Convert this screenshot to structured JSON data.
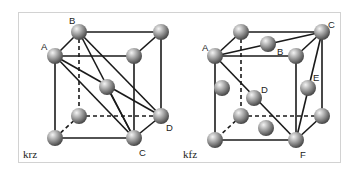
{
  "figure": {
    "panels": [
      {
        "id": "bcc",
        "caption": "krz",
        "point_labels": [
          "A",
          "B",
          "C",
          "D"
        ]
      },
      {
        "id": "fcc",
        "caption": "kfz",
        "point_labels": [
          "A",
          "B",
          "C",
          "D",
          "E",
          "F"
        ]
      }
    ],
    "colors": {
      "atom_light": "#f0f0f0",
      "atom_dark": "#5a5a5a",
      "line": "#1a1a1a",
      "frame": "#d2d2d2"
    }
  }
}
